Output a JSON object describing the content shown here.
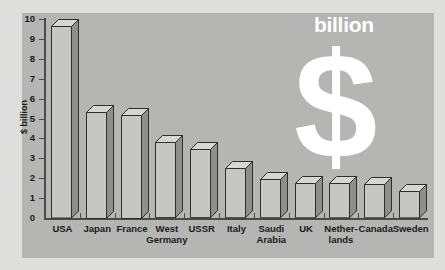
{
  "chart_data": {
    "type": "bar",
    "title": "",
    "subtitle": "",
    "xlabel": "",
    "ylabel": "$ billion",
    "ylim": [
      0,
      10
    ],
    "grid": false,
    "legend": "none",
    "style": "3d-extruded-bars",
    "categories": [
      "USA",
      "Japan",
      "France",
      "West Germany",
      "USSR",
      "Italy",
      "Saudi Arabia",
      "UK",
      "Netherlands",
      "Canada",
      "Sweden"
    ],
    "category_labels": [
      {
        "line1": "USA",
        "line2": ""
      },
      {
        "line1": "Japan",
        "line2": ""
      },
      {
        "line1": "France",
        "line2": ""
      },
      {
        "line1": "West",
        "line2": "Germany"
      },
      {
        "line1": "USSR",
        "line2": ""
      },
      {
        "line1": "Italy",
        "line2": ""
      },
      {
        "line1": "Saudi",
        "line2": "Arabia"
      },
      {
        "line1": "UK",
        "line2": ""
      },
      {
        "line1": "Nether-",
        "line2": "lands"
      },
      {
        "line1": "Canada",
        "line2": ""
      },
      {
        "line1": "Sweden",
        "line2": ""
      }
    ],
    "values": [
      9.65,
      5.35,
      5.2,
      3.8,
      3.45,
      2.5,
      1.95,
      1.75,
      1.75,
      1.7,
      1.35
    ],
    "ytick_labels": [
      "0",
      "1",
      "2",
      "3",
      "4",
      "5",
      "6",
      "7",
      "8",
      "9",
      "10"
    ],
    "ytick_values": [
      0,
      1,
      2,
      3,
      4,
      5,
      6,
      7,
      8,
      9,
      10
    ],
    "annotation": {
      "billion_text": "billion",
      "dollar_symbol": "$"
    },
    "colors": {
      "outer_background": "#dededc",
      "panel_background": "#b5b5b3",
      "bar_front": "#c6c6c4",
      "bar_side": "#8e8e8c",
      "bar_top": "#d6d6d4",
      "bar_outline": "#2e2e2c",
      "axis": "#4a4a48",
      "text": "#1a1a1a",
      "annotation_text": "#ffffff"
    }
  }
}
